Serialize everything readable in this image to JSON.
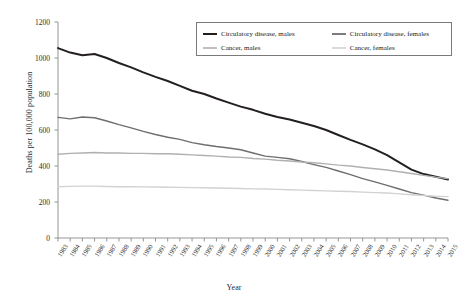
{
  "chart_data": {
    "type": "line",
    "title": "",
    "xlabel": "Year",
    "ylabel": "Deaths per 100,000 population",
    "ylim": [
      0,
      1200
    ],
    "yticks": [
      0,
      200,
      400,
      600,
      800,
      1000,
      1200
    ],
    "grid": false,
    "legend_position": "top-right",
    "x": [
      1983,
      1984,
      1985,
      1986,
      1987,
      1988,
      1989,
      1990,
      1991,
      1992,
      1993,
      1994,
      1995,
      1996,
      1997,
      1998,
      1999,
      2000,
      2001,
      2002,
      2003,
      2004,
      2005,
      2006,
      2007,
      2008,
      2009,
      2010,
      2011,
      2012,
      2013,
      2014,
      2015
    ],
    "categories": [
      "1983",
      "1984",
      "1985",
      "1986",
      "1987",
      "1988",
      "1989",
      "1990",
      "1991",
      "1992",
      "1993",
      "1994",
      "1995",
      "1996",
      "1997",
      "1998",
      "1999",
      "2000",
      "2001",
      "2002",
      "2003",
      "2004",
      "2005",
      "2006",
      "2007",
      "2008",
      "2009",
      "2010",
      "2011",
      "2012",
      "2013",
      "2014",
      "2015"
    ],
    "series": [
      {
        "name": "Circulatory disease, males",
        "color": "#231f20",
        "width": 2.0,
        "values": [
          1055,
          1030,
          1015,
          1022,
          1000,
          972,
          948,
          920,
          895,
          872,
          845,
          818,
          800,
          775,
          752,
          730,
          712,
          690,
          672,
          658,
          640,
          622,
          600,
          572,
          545,
          520,
          492,
          460,
          420,
          380,
          355,
          340,
          325
        ]
      },
      {
        "name": "Circulatory disease, females",
        "color": "#6e6e6e",
        "width": 1.4,
        "values": [
          670,
          662,
          672,
          668,
          650,
          630,
          612,
          592,
          575,
          560,
          548,
          530,
          518,
          508,
          500,
          490,
          472,
          455,
          448,
          440,
          425,
          408,
          392,
          372,
          352,
          330,
          312,
          292,
          272,
          252,
          238,
          222,
          210
        ]
      },
      {
        "name": "Cancer, males",
        "color": "#b0b0b0",
        "width": 1.4,
        "values": [
          465,
          470,
          472,
          475,
          472,
          472,
          470,
          470,
          468,
          468,
          465,
          462,
          458,
          455,
          450,
          448,
          442,
          438,
          432,
          428,
          422,
          418,
          412,
          405,
          400,
          392,
          385,
          378,
          368,
          358,
          348,
          338,
          330
        ]
      },
      {
        "name": "Cancer, females",
        "color": "#d2d2d2",
        "width": 1.4,
        "values": [
          285,
          287,
          288,
          288,
          286,
          285,
          285,
          284,
          283,
          282,
          281,
          280,
          279,
          278,
          276,
          275,
          273,
          272,
          270,
          268,
          266,
          264,
          262,
          260,
          258,
          255,
          252,
          250,
          245,
          240,
          236,
          232,
          230
        ]
      }
    ]
  },
  "legend": {
    "entries": [
      {
        "label": "Circulatory disease, males"
      },
      {
        "label": "Circulatory disease, females"
      },
      {
        "label": "Cancer, males"
      },
      {
        "label": "Cancer, females"
      }
    ]
  }
}
